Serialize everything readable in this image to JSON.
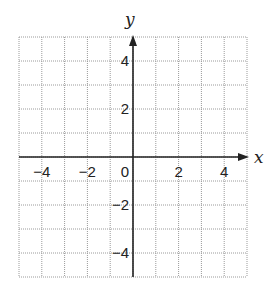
{
  "chart_data": {
    "type": "coordinate-grid",
    "title": "",
    "xlabel": "x",
    "ylabel": "y",
    "xlim": [
      -5,
      5
    ],
    "ylim": [
      -5,
      5
    ],
    "grid": true,
    "grid_style": "dotted",
    "grid_step": 1,
    "x_ticks": [
      {
        "value": -4,
        "label": "−4"
      },
      {
        "value": -2,
        "label": "−2"
      },
      {
        "value": 0,
        "label": "0"
      },
      {
        "value": 2,
        "label": "2"
      },
      {
        "value": 4,
        "label": "4"
      }
    ],
    "y_ticks": [
      {
        "value": 4,
        "label": "4"
      },
      {
        "value": 2,
        "label": "2"
      },
      {
        "value": -2,
        "label": "−2"
      },
      {
        "value": -4,
        "label": "−4"
      }
    ],
    "series": [],
    "colors": {
      "axis": "#222222",
      "grid": "#9a9a9a",
      "background": "#ffffff"
    }
  },
  "layout": {
    "left": 19,
    "right": 247,
    "top": 37,
    "bottom": 277
  }
}
